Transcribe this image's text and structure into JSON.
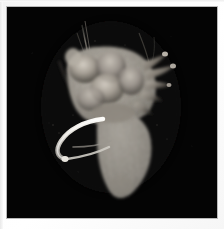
{
  "image": {
    "kind": "specimen-photograph",
    "subject": "excised heart specimen with cannula",
    "modality": "volume rendering / specimen photograph",
    "alt_text": "Grayscale volumetric rendering of an excised heart specimen with attached vessels and a bright cannula, on a black background",
    "width_px": 224,
    "height_px": 229,
    "has_text_labels": false,
    "has_scale_bar": false,
    "colors": {
      "page_background": "#ffffff",
      "print_margin": "#fafafa",
      "frame_line": "#b9b9b9",
      "canvas_background": "#040404",
      "tissue_midtone": "#9a958d",
      "tissue_highlight": "#cfc9c0",
      "tissue_shadow": "#4a463f",
      "cannula_bright": "#f0efec",
      "filament_dim": "#57534d"
    },
    "canvas": {
      "x": 7,
      "y": 7,
      "width": 210,
      "height": 211
    }
  },
  "subject_parts": [
    {
      "name": "upper-tissue-mass",
      "label": "atrial and great-vessel mass"
    },
    {
      "name": "ventricle-body",
      "label": "conical ventricular body"
    },
    {
      "name": "right-projections",
      "label": "finger-like vessel projections"
    },
    {
      "name": "cannula-tube",
      "label": "bright curved cannula"
    },
    {
      "name": "upper-filaments",
      "label": "thin suture filaments"
    }
  ]
}
